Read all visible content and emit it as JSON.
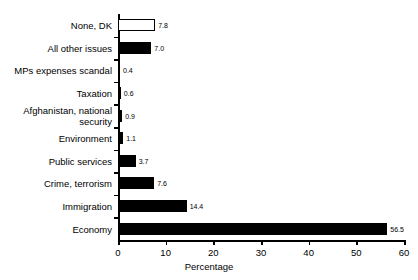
{
  "chart_data": {
    "type": "bar",
    "orientation": "horizontal",
    "title": "",
    "xlabel": "Percentage",
    "ylabel": "",
    "xlim": [
      0,
      60
    ],
    "xticks": [
      0,
      10,
      20,
      30,
      40,
      50,
      60
    ],
    "grid": false,
    "legend": null,
    "categories": [
      "None, DK",
      "All other issues",
      "MPs expenses scandal",
      "Taxation",
      "Afghanistan, national\nsecurity",
      "Environment",
      "Public services",
      "Crime, terrorism",
      "Immigration",
      "Economy"
    ],
    "values": [
      7.8,
      7.0,
      0.4,
      0.6,
      0.9,
      1.1,
      3.7,
      7.6,
      14.4,
      56.5
    ],
    "value_labels": [
      "7.8",
      "7.0",
      "0.4",
      "0.6",
      "0.9",
      "1.1",
      "3.7",
      "7.6",
      "14.4",
      "56.5"
    ],
    "bar_styles": [
      "hollow",
      "filled",
      "filled",
      "filled",
      "filled",
      "filled",
      "filled",
      "filled",
      "filled",
      "filled"
    ],
    "colors": {
      "bar_fill": "#000000",
      "bar_hollow_fill": "#ffffff",
      "bar_edge": "#000000",
      "axis": "#000000",
      "text": "#000000",
      "background": "#ffffff"
    }
  }
}
